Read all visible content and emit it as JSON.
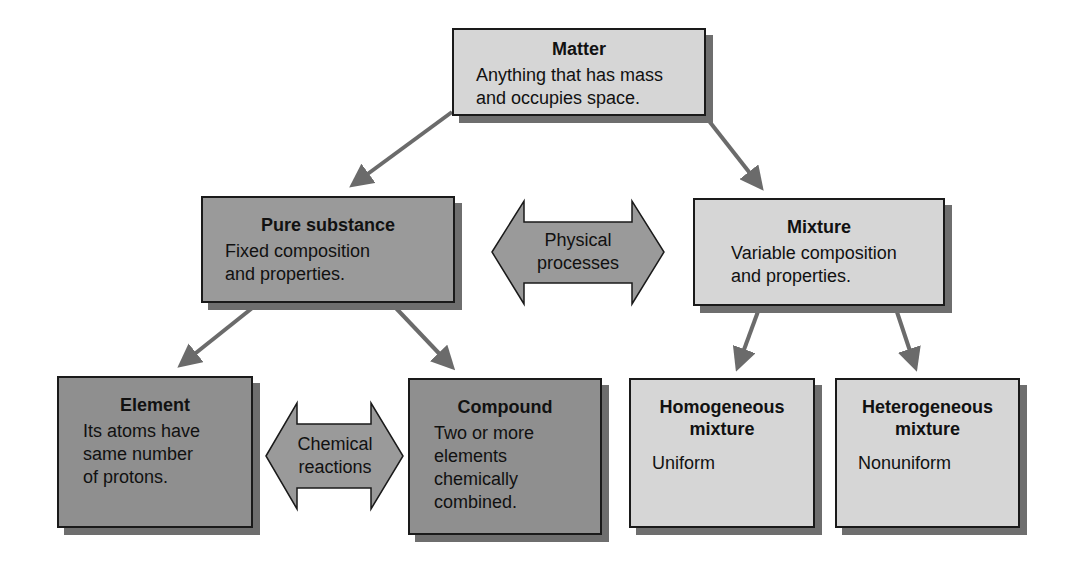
{
  "diagram": {
    "nodes": {
      "matter": {
        "title": "Matter",
        "description_lines": [
          "Anything that has mass",
          "and occupies space."
        ]
      },
      "pure_substance": {
        "title": "Pure substance",
        "description_lines": [
          "Fixed composition",
          "and properties."
        ]
      },
      "mixture": {
        "title": "Mixture",
        "description_lines": [
          "Variable composition",
          "and properties."
        ]
      },
      "element": {
        "title": "Element",
        "description_lines": [
          "Its atoms have",
          "same number",
          "of protons."
        ]
      },
      "compound": {
        "title": "Compound",
        "description_lines": [
          "Two or more",
          "elements",
          "chemically",
          "combined."
        ]
      },
      "homogeneous": {
        "title_lines": [
          "Homogeneous",
          "mixture"
        ],
        "description": "Uniform"
      },
      "heterogeneous": {
        "title_lines": [
          "Heterogeneous",
          "mixture"
        ],
        "description": "Nonuniform"
      }
    },
    "bidirectional_arrows": {
      "physical": {
        "label_lines": [
          "Physical",
          "processes"
        ],
        "connects": [
          "Pure substance",
          "Mixture"
        ]
      },
      "chemical": {
        "label_lines": [
          "Chemical",
          "reactions"
        ],
        "connects": [
          "Element",
          "Compound"
        ]
      }
    },
    "edges": [
      {
        "from": "Matter",
        "to": "Pure substance"
      },
      {
        "from": "Matter",
        "to": "Mixture"
      },
      {
        "from": "Pure substance",
        "to": "Element"
      },
      {
        "from": "Pure substance",
        "to": "Compound"
      },
      {
        "from": "Mixture",
        "to": "Homogeneous mixture"
      },
      {
        "from": "Mixture",
        "to": "Heterogeneous mixture"
      }
    ],
    "colors": {
      "light_box": "#d6d6d6",
      "dark_box": "#9a9a9a",
      "arrow": "#6b6b6b",
      "shadow": "#6e6e6e",
      "border": "#1a1a1a"
    }
  }
}
